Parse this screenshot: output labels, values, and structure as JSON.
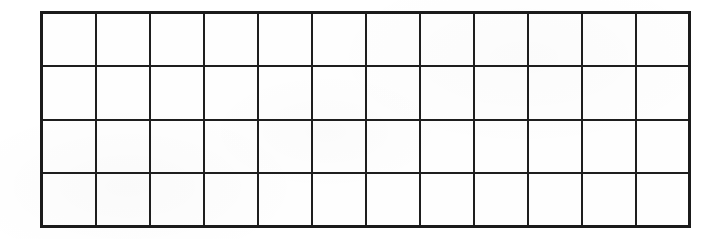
{
  "document": {
    "kind": "blank-grid-table",
    "background_color": "#ffffff",
    "paper_color": "#fefefe",
    "line_color": "#1e1e1e",
    "outer_border_color": "#1b1b1b"
  },
  "grid": {
    "columns": 12,
    "rows": 4,
    "cell_width_px": 54,
    "cell_height_px": 54,
    "left_px": 40,
    "top_px": 11,
    "width_px": 648,
    "height_px": 217,
    "outer_border_px": 3,
    "inner_line_px": 2
  },
  "cells": [
    [
      "",
      "",
      "",
      "",
      "",
      "",
      "",
      "",
      "",
      "",
      "",
      ""
    ],
    [
      "",
      "",
      "",
      "",
      "",
      "",
      "",
      "",
      "",
      "",
      "",
      ""
    ],
    [
      "",
      "",
      "",
      "",
      "",
      "",
      "",
      "",
      "",
      "",
      "",
      ""
    ],
    [
      "",
      "",
      "",
      "",
      "",
      "",
      "",
      "",
      "",
      "",
      "",
      ""
    ]
  ]
}
